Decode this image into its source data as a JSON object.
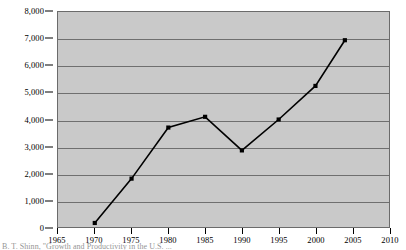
{
  "figure": {
    "background_color": "#ffffff",
    "plot_background_color": "#c9c9c9",
    "gridline_color": "#6f6f6f",
    "line_color": "#000000",
    "marker_color": "#000000",
    "caption_clipped": "B. T. Shinn, \"Growth and Productivity in the U.S. ...",
    "caption_note": "clipped"
  },
  "chart_data": {
    "type": "line",
    "title": "",
    "subtitle": "",
    "xlabel": "",
    "ylabel": "",
    "xlim": [
      1965,
      2010
    ],
    "ylim": [
      0,
      8000
    ],
    "grid": true,
    "legend": "none",
    "x_tick_labels": [
      "1965",
      "1970",
      "1975",
      "1980",
      "1985",
      "1990",
      "1995",
      "2000",
      "2005",
      "2010"
    ],
    "x_ticks": [
      1965,
      1970,
      1975,
      1980,
      1985,
      1990,
      1995,
      2000,
      2005,
      2010
    ],
    "y_tick_labels": [
      "0",
      "1,000",
      "2,000",
      "3,000",
      "4,000",
      "5,000",
      "6,000",
      "7,000",
      "8,000"
    ],
    "y_ticks": [
      0,
      1000,
      2000,
      3000,
      4000,
      5000,
      6000,
      7000,
      8000
    ],
    "series": [
      {
        "name": "series-1",
        "x": [
          1970,
          1975,
          1980,
          1985,
          1990,
          1995,
          2000,
          2004
        ],
        "values": [
          150,
          1800,
          3700,
          4100,
          2850,
          4000,
          5250,
          6950
        ]
      }
    ]
  }
}
